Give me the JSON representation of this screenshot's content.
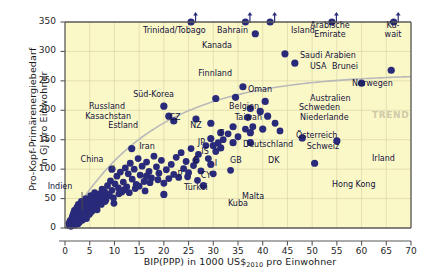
{
  "chart_data": {
    "type": "scatter",
    "title": "",
    "xlabel": "BIP(PPP) in 1000 US$2010 pro Einwohner",
    "xlabel_main": "BIP(PPP) in 1000 US$",
    "xlabel_sub": "2010",
    "xlabel_tail": " pro Einwohner",
    "ylabel_line1": "Pro-Kopf-Primärenergiebedarf",
    "ylabel_line2": "in GJ pro Einwohner",
    "xlim": [
      0,
      70
    ],
    "ylim": [
      0,
      350
    ],
    "xticks": [
      0,
      5,
      10,
      15,
      20,
      25,
      30,
      35,
      40,
      45,
      50,
      55,
      60,
      65,
      70
    ],
    "yticks": [
      0,
      50,
      100,
      150,
      200,
      250,
      300,
      350
    ],
    "grid": true,
    "legend": "none",
    "annotation_trend": "TREND",
    "marker_color": "#2a2a7a",
    "plot_bg": "#fbf8c8",
    "axis_color": "#595959",
    "grid_color": "#d8d4a8",
    "trend_color": "#b9b9b9",
    "labeled_points": [
      {
        "name": "Trinidad/Tobago",
        "x": 25.5,
        "y": 350,
        "clipped": true,
        "lx": 143,
        "ly": 27,
        "anchor": "start"
      },
      {
        "name": "Bahrain",
        "x": 36.5,
        "y": 350,
        "clipped": true,
        "lx": 248,
        "ly": 27,
        "anchor": "end"
      },
      {
        "name": "Island",
        "x": 41.5,
        "y": 350,
        "clipped": true,
        "lx": 291,
        "ly": 27,
        "anchor": "start"
      },
      {
        "name": "Arabische Emirate",
        "x": 54.0,
        "y": 350,
        "clipped": true,
        "lx": 330,
        "ly": 22,
        "anchor": "two"
      },
      {
        "name": "Ku-wait",
        "x": 66.5,
        "y": 350,
        "clipped": true,
        "lx": 393,
        "ly": 22,
        "anchor": "two"
      },
      {
        "name": "Kanada",
        "x": 38.5,
        "y": 330,
        "lx": 232,
        "ly": 42,
        "anchor": "end"
      },
      {
        "name": "Saudi Arabien",
        "x": 44.5,
        "y": 296,
        "lx": 300,
        "ly": 52,
        "anchor": "start"
      },
      {
        "name": "USA",
        "x": 46.5,
        "y": 280,
        "lx": 310,
        "ly": 63,
        "anchor": "start"
      },
      {
        "name": "Brunei",
        "x": 66.0,
        "y": 268,
        "lx": 358,
        "ly": 63,
        "anchor": "end"
      },
      {
        "name": "Norwegen",
        "x": 60.0,
        "y": 246,
        "lx": 352,
        "ly": 80,
        "anchor": "start"
      },
      {
        "name": "Finnland",
        "x": 36.0,
        "y": 240,
        "lx": 232,
        "ly": 70,
        "anchor": "end"
      },
      {
        "name": "Oman",
        "x": 34.5,
        "y": 222,
        "lx": 248,
        "ly": 86,
        "anchor": "start"
      },
      {
        "name": "Süd-Korea",
        "x": 30.5,
        "y": 220,
        "lx": 174,
        "ly": 91,
        "anchor": "end"
      },
      {
        "name": "Australien",
        "x": 40.5,
        "y": 215,
        "lx": 310,
        "ly": 95,
        "anchor": "start"
      },
      {
        "name": "Russland",
        "x": 20.0,
        "y": 207,
        "lx": 125,
        "ly": 103,
        "anchor": "end"
      },
      {
        "name": "Belgien",
        "x": 37.5,
        "y": 203,
        "lx": 259,
        "ly": 103,
        "anchor": "end"
      },
      {
        "name": "Schweden",
        "x": 39.5,
        "y": 198,
        "lx": 299,
        "ly": 104,
        "anchor": "start"
      },
      {
        "name": "Kasachstan",
        "x": 21.0,
        "y": 190,
        "lx": 131,
        "ly": 113,
        "anchor": "end"
      },
      {
        "name": "Niederlande",
        "x": 41.0,
        "y": 190,
        "lx": 300,
        "ly": 114,
        "anchor": "start"
      },
      {
        "name": "Taiwan",
        "x": 37.0,
        "y": 188,
        "lx": 262,
        "ly": 114,
        "anchor": "end"
      },
      {
        "name": "Estland",
        "x": 22.0,
        "y": 182,
        "lx": 138,
        "ly": 122,
        "anchor": "end"
      },
      {
        "name": "CZ",
        "x": 26.5,
        "y": 185,
        "lx": 175,
        "ly": 114,
        "anchor": "mid"
      },
      {
        "name": "NZ",
        "x": 29.5,
        "y": 178,
        "lx": 196,
        "ly": 122,
        "anchor": "mid"
      },
      {
        "name": "Österreich",
        "x": 40.0,
        "y": 168,
        "lx": 296,
        "ly": 132,
        "anchor": "start"
      },
      {
        "name": "F",
        "x": 34.0,
        "y": 172,
        "lx": 222,
        "ly": 130,
        "anchor": "mid"
      },
      {
        "name": "JP",
        "x": 31.5,
        "y": 162,
        "lx": 205,
        "ly": 139,
        "anchor": "end"
      },
      {
        "name": "Deutschland",
        "x": 37.5,
        "y": 162,
        "lx": 243,
        "ly": 141,
        "anchor": "start"
      },
      {
        "name": "Schweiz",
        "x": 48.0,
        "y": 153,
        "lx": 323,
        "ly": 143,
        "anchor": "mid"
      },
      {
        "name": "IS",
        "x": 29.5,
        "y": 152,
        "lx": 205,
        "ly": 148,
        "anchor": "mid"
      },
      {
        "name": "Irland",
        "x": 55.0,
        "y": 148,
        "lx": 372,
        "ly": 155,
        "anchor": "start"
      },
      {
        "name": "GB",
        "x": 34.0,
        "y": 145,
        "lx": 230,
        "ly": 157,
        "anchor": "start"
      },
      {
        "name": "DK",
        "x": 37.5,
        "y": 145,
        "lx": 268,
        "ly": 157,
        "anchor": "start"
      },
      {
        "name": "E",
        "x": 30.0,
        "y": 140,
        "lx": 196,
        "ly": 157,
        "anchor": "mid"
      },
      {
        "name": "I",
        "x": 31.5,
        "y": 136,
        "lx": 216,
        "ly": 160,
        "anchor": "mid"
      },
      {
        "name": "Iran",
        "x": 13.5,
        "y": 135,
        "lx": 147,
        "ly": 143,
        "anchor": "mid"
      },
      {
        "name": "China",
        "x": 9.5,
        "y": 100,
        "lx": 92,
        "ly": 156,
        "anchor": "mid",
        "leader": true
      },
      {
        "name": "P",
        "x": 26.5,
        "y": 115,
        "lx": 180,
        "ly": 171,
        "anchor": "mid"
      },
      {
        "name": "CY",
        "x": 29.5,
        "y": 108,
        "lx": 206,
        "ly": 172,
        "anchor": "mid"
      },
      {
        "name": "Hong Kong",
        "x": 50.5,
        "y": 110,
        "lx": 332,
        "ly": 181,
        "anchor": "start"
      },
      {
        "name": "Türkei",
        "x": 16.5,
        "y": 88,
        "lx": 184,
        "ly": 184,
        "anchor": "start"
      },
      {
        "name": "Indien",
        "x": 3.5,
        "y": 30,
        "lx": 60,
        "ly": 183,
        "anchor": "mid",
        "leader": true
      },
      {
        "name": "Malta",
        "x": 28.0,
        "y": 72,
        "lx": 242,
        "ly": 193,
        "anchor": "start"
      },
      {
        "name": "Kuba",
        "x": 20.0,
        "y": 57,
        "lx": 228,
        "ly": 200,
        "anchor": "start"
      }
    ],
    "unlabeled_points": [
      [
        0.8,
        8
      ],
      [
        1.0,
        12
      ],
      [
        1.1,
        6
      ],
      [
        1.3,
        15
      ],
      [
        1.4,
        9
      ],
      [
        1.5,
        20
      ],
      [
        1.6,
        11
      ],
      [
        1.7,
        25
      ],
      [
        1.8,
        14
      ],
      [
        1.9,
        30
      ],
      [
        2.0,
        18
      ],
      [
        2.1,
        22
      ],
      [
        2.2,
        10
      ],
      [
        2.3,
        28
      ],
      [
        2.4,
        35
      ],
      [
        2.5,
        16
      ],
      [
        2.6,
        24
      ],
      [
        2.7,
        40
      ],
      [
        2.8,
        19
      ],
      [
        2.9,
        32
      ],
      [
        3.0,
        26
      ],
      [
        3.1,
        38
      ],
      [
        3.2,
        21
      ],
      [
        3.3,
        45
      ],
      [
        3.4,
        29
      ],
      [
        3.6,
        34
      ],
      [
        3.8,
        42
      ],
      [
        4.0,
        27
      ],
      [
        4.2,
        50
      ],
      [
        4.4,
        36
      ],
      [
        4.6,
        31
      ],
      [
        4.8,
        44
      ],
      [
        5.0,
        39
      ],
      [
        5.2,
        55
      ],
      [
        5.4,
        33
      ],
      [
        5.6,
        47
      ],
      [
        5.8,
        41
      ],
      [
        6.0,
        60
      ],
      [
        6.2,
        37
      ],
      [
        6.4,
        52
      ],
      [
        6.6,
        46
      ],
      [
        6.8,
        43
      ],
      [
        7.0,
        58
      ],
      [
        7.2,
        49
      ],
      [
        7.5,
        66
      ],
      [
        7.8,
        54
      ],
      [
        8.0,
        62
      ],
      [
        8.3,
        48
      ],
      [
        8.6,
        72
      ],
      [
        8.9,
        57
      ],
      [
        9.2,
        80
      ],
      [
        9.5,
        64
      ],
      [
        9.8,
        51
      ],
      [
        10.1,
        75
      ],
      [
        10.5,
        88
      ],
      [
        10.8,
        68
      ],
      [
        11.2,
        95
      ],
      [
        11.5,
        61
      ],
      [
        11.8,
        78
      ],
      [
        12.2,
        102
      ],
      [
        12.5,
        70
      ],
      [
        12.8,
        92
      ],
      [
        13.2,
        110
      ],
      [
        13.6,
        83
      ],
      [
        14.0,
        100
      ],
      [
        14.4,
        74
      ],
      [
        14.8,
        118
      ],
      [
        15.2,
        90
      ],
      [
        15.6,
        105
      ],
      [
        16.0,
        79
      ],
      [
        16.5,
        112
      ],
      [
        17.0,
        96
      ],
      [
        17.5,
        85
      ],
      [
        18.0,
        122
      ],
      [
        18.5,
        104
      ],
      [
        19.0,
        93
      ],
      [
        19.5,
        115
      ],
      [
        20.5,
        99
      ],
      [
        21.5,
        108
      ],
      [
        22.5,
        120
      ],
      [
        23.0,
        86
      ],
      [
        23.5,
        128
      ],
      [
        24.0,
        101
      ],
      [
        24.5,
        113
      ],
      [
        25.0,
        94
      ],
      [
        25.5,
        135
      ],
      [
        26.0,
        106
      ],
      [
        27.0,
        125
      ],
      [
        27.5,
        97
      ],
      [
        28.5,
        140
      ],
      [
        29.0,
        118
      ],
      [
        30.5,
        130
      ],
      [
        31.0,
        145
      ],
      [
        32.0,
        150
      ],
      [
        33.0,
        160
      ],
      [
        35.0,
        155
      ],
      [
        36.5,
        168
      ],
      [
        38.0,
        172
      ],
      [
        42.5,
        178
      ],
      [
        43.5,
        165
      ],
      [
        2.0,
        5
      ],
      [
        2.6,
        7
      ],
      [
        3.5,
        13
      ],
      [
        4.1,
        17
      ],
      [
        4.9,
        23
      ],
      [
        5.5,
        29
      ],
      [
        6.1,
        35
      ],
      [
        1.2,
        3
      ],
      [
        0.9,
        4
      ],
      [
        1.45,
        7
      ],
      [
        2.15,
        12
      ],
      [
        2.85,
        9
      ],
      [
        3.75,
        22
      ],
      [
        4.35,
        16
      ],
      [
        5.15,
        26
      ],
      [
        6.5,
        31
      ],
      [
        7.35,
        40
      ],
      [
        8.1,
        45
      ],
      [
        9.0,
        55
      ],
      [
        9.9,
        42
      ],
      [
        10.9,
        58
      ],
      [
        12.0,
        65
      ],
      [
        13.0,
        60
      ],
      [
        14.2,
        67
      ],
      [
        15.0,
        71
      ],
      [
        16.2,
        63
      ],
      [
        17.2,
        77
      ],
      [
        18.8,
        82
      ],
      [
        20.0,
        76
      ],
      [
        21.0,
        84
      ],
      [
        22.0,
        91
      ],
      [
        24.8,
        87
      ],
      [
        26.8,
        81
      ],
      [
        30.0,
        92
      ],
      [
        33.5,
        98
      ]
    ]
  }
}
